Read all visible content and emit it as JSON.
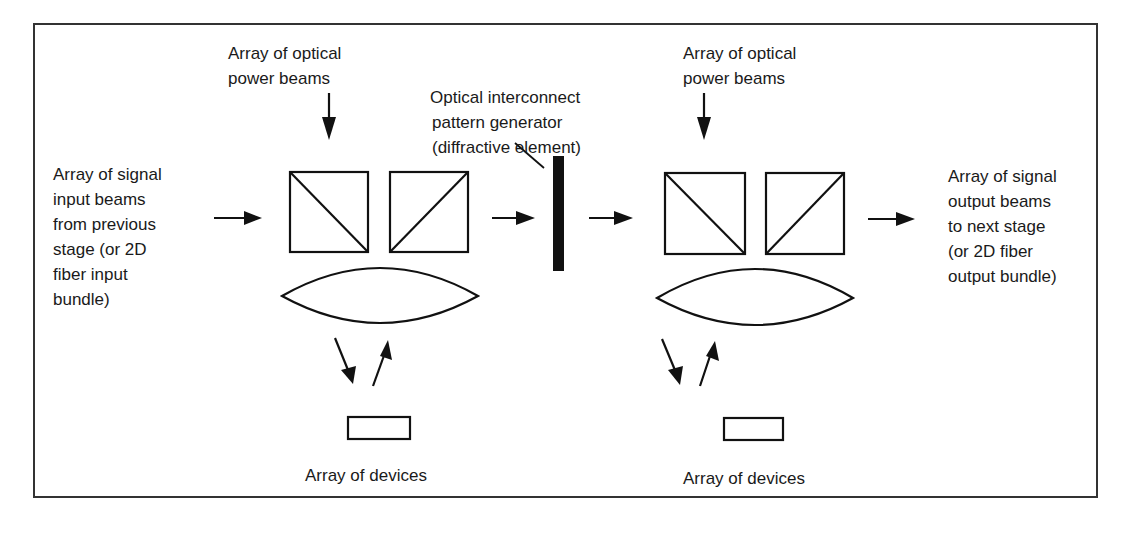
{
  "diagram": {
    "labels": {
      "input_beams": [
        "Array of signal",
        "input beams",
        "from previous",
        "stage (or 2D",
        "fiber input",
        "bundle)"
      ],
      "power_beams_left": [
        "Array of optical",
        "power beams"
      ],
      "pattern_generator": [
        "Optical interconnect",
        "pattern generator",
        "(diffractive element)"
      ],
      "power_beams_right": [
        "Array of optical",
        "power beams"
      ],
      "output_beams": [
        "Array of signal",
        "output beams",
        "to next stage",
        "(or 2D fiber",
        "output bundle)"
      ],
      "devices_left": "Array of devices",
      "devices_right": "Array of devices"
    },
    "colors": {
      "line": "#111111",
      "text": "#1a1a1a",
      "border": "#333333",
      "background": "#ffffff"
    }
  }
}
